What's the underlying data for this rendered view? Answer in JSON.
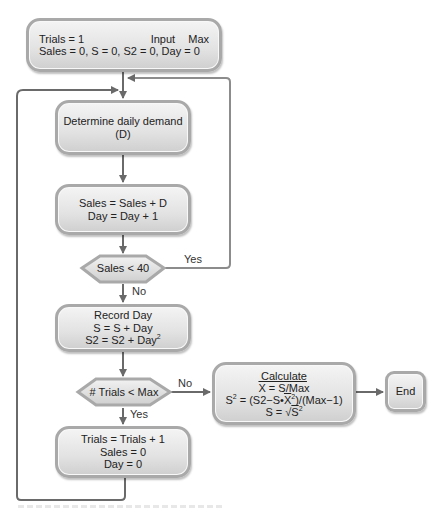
{
  "colors": {
    "box_border": "#a9a9a9",
    "box_fill_top": "#f4f4f4",
    "box_fill_bottom": "#cfcfcf",
    "connector": "#6a6a6a",
    "loop_line": "#8c8c8c"
  },
  "nodes": {
    "init": {
      "line1_left": "Trials = 1",
      "line1_right_a": "Input",
      "line1_right_b": "Max",
      "line2": "Sales = 0, S = 0, S2 = 0, Day = 0"
    },
    "demand": {
      "line1": "Determine daily demand",
      "line2": "(D)"
    },
    "update": {
      "line1": "Sales = Sales + D",
      "line2": "Day = Day + 1"
    },
    "decision_sales": {
      "text": "Sales < 40",
      "yes_label": "Yes",
      "no_label": "No"
    },
    "record": {
      "line1": "Record Day",
      "line2": "S = S + Day",
      "line3_base": "S2 = S2 + Day",
      "line3_sup": "2"
    },
    "decision_trials": {
      "text": "# Trials < Max",
      "yes_label": "Yes",
      "no_label": "No"
    },
    "calculate": {
      "line1": "Calculate",
      "line2_x": "X",
      "line2_rest": " = S/Max",
      "line3_a": "S",
      "line3_sup": "2",
      "line3_b": " = (S2−S•",
      "line3_x": "X",
      "line3_sup2": "2",
      "line3_c": ")/(Max−1)",
      "line4_a": "S = √",
      "line4_b": "S",
      "line4_sup": "2"
    },
    "reset": {
      "line1": "Trials = Trials + 1",
      "line2": "Sales = 0",
      "line3": "Day = 0"
    },
    "end": {
      "text": "End"
    }
  }
}
